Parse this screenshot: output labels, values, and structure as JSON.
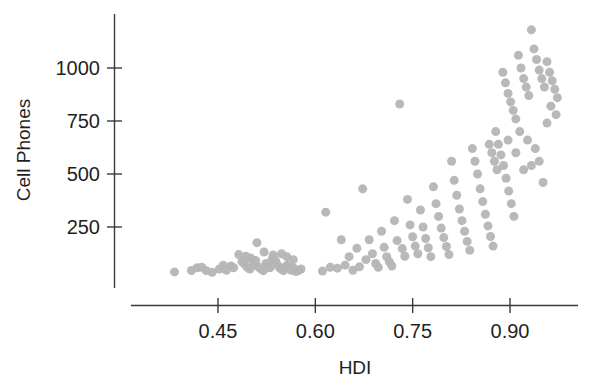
{
  "chart_data": {
    "type": "scatter",
    "title": "",
    "xlabel": "HDI",
    "ylabel": "Cell Phones",
    "xlim": [
      0.36,
      0.99
    ],
    "ylim": [
      0,
      1210
    ],
    "xticks": [
      0.45,
      0.6,
      0.75,
      0.9
    ],
    "xticklabels": [
      "0.45",
      "0.60",
      "0.75",
      "0.90"
    ],
    "yticks": [
      250,
      500,
      750,
      1000
    ],
    "yticklabels": [
      "250",
      "500",
      "750",
      "1000"
    ],
    "grid": false,
    "legend": null,
    "marker": {
      "shape": "circle",
      "color": "#b5b5b5",
      "size": 9,
      "opacity": 0.95
    },
    "axis_color": "#3a3a3a",
    "background": "#ffffff",
    "n_points": 152,
    "points": [
      [
        0.383,
        38
      ],
      [
        0.409,
        45
      ],
      [
        0.418,
        58
      ],
      [
        0.425,
        60
      ],
      [
        0.432,
        44
      ],
      [
        0.441,
        36
      ],
      [
        0.452,
        52
      ],
      [
        0.458,
        70
      ],
      [
        0.463,
        46
      ],
      [
        0.47,
        66
      ],
      [
        0.474,
        58
      ],
      [
        0.482,
        120
      ],
      [
        0.487,
        86
      ],
      [
        0.491,
        74
      ],
      [
        0.495,
        60
      ],
      [
        0.499,
        52
      ],
      [
        0.503,
        96
      ],
      [
        0.506,
        70
      ],
      [
        0.51,
        176
      ],
      [
        0.513,
        60
      ],
      [
        0.517,
        50
      ],
      [
        0.52,
        44
      ],
      [
        0.524,
        78
      ],
      [
        0.527,
        62
      ],
      [
        0.53,
        58
      ],
      [
        0.533,
        96
      ],
      [
        0.536,
        102
      ],
      [
        0.539,
        88
      ],
      [
        0.542,
        70
      ],
      [
        0.545,
        58
      ],
      [
        0.548,
        50
      ],
      [
        0.551,
        44
      ],
      [
        0.554,
        62
      ],
      [
        0.557,
        70
      ],
      [
        0.56,
        56
      ],
      [
        0.563,
        46
      ],
      [
        0.566,
        58
      ],
      [
        0.57,
        40
      ],
      [
        0.574,
        44
      ],
      [
        0.578,
        52
      ],
      [
        0.521,
        132
      ],
      [
        0.535,
        118
      ],
      [
        0.548,
        124
      ],
      [
        0.556,
        110
      ],
      [
        0.566,
        96
      ],
      [
        0.5,
        104
      ],
      [
        0.508,
        92
      ],
      [
        0.493,
        112
      ],
      [
        0.611,
        42
      ],
      [
        0.616,
        320
      ],
      [
        0.623,
        60
      ],
      [
        0.634,
        56
      ],
      [
        0.64,
        190
      ],
      [
        0.646,
        70
      ],
      [
        0.652,
        110
      ],
      [
        0.658,
        46
      ],
      [
        0.664,
        150
      ],
      [
        0.668,
        62
      ],
      [
        0.673,
        430
      ],
      [
        0.678,
        96
      ],
      [
        0.683,
        190
      ],
      [
        0.688,
        124
      ],
      [
        0.693,
        78
      ],
      [
        0.697,
        60
      ],
      [
        0.702,
        230
      ],
      [
        0.706,
        154
      ],
      [
        0.71,
        110
      ],
      [
        0.714,
        86
      ],
      [
        0.718,
        66
      ],
      [
        0.722,
        280
      ],
      [
        0.726,
        186
      ],
      [
        0.73,
        830
      ],
      [
        0.734,
        148
      ],
      [
        0.738,
        112
      ],
      [
        0.742,
        380
      ],
      [
        0.746,
        260
      ],
      [
        0.75,
        204
      ],
      [
        0.754,
        160
      ],
      [
        0.758,
        124
      ],
      [
        0.762,
        330
      ],
      [
        0.766,
        250
      ],
      [
        0.77,
        196
      ],
      [
        0.774,
        152
      ],
      [
        0.778,
        110
      ],
      [
        0.782,
        440
      ],
      [
        0.786,
        360
      ],
      [
        0.79,
        300
      ],
      [
        0.794,
        245
      ],
      [
        0.798,
        200
      ],
      [
        0.802,
        158
      ],
      [
        0.806,
        120
      ],
      [
        0.81,
        560
      ],
      [
        0.814,
        470
      ],
      [
        0.818,
        400
      ],
      [
        0.822,
        335
      ],
      [
        0.826,
        280
      ],
      [
        0.83,
        230
      ],
      [
        0.834,
        182
      ],
      [
        0.838,
        140
      ],
      [
        0.842,
        620
      ],
      [
        0.846,
        560
      ],
      [
        0.85,
        500
      ],
      [
        0.854,
        430
      ],
      [
        0.858,
        370
      ],
      [
        0.862,
        310
      ],
      [
        0.866,
        255
      ],
      [
        0.87,
        205
      ],
      [
        0.874,
        160
      ],
      [
        0.878,
        700
      ],
      [
        0.882,
        640
      ],
      [
        0.886,
        590
      ],
      [
        0.89,
        540
      ],
      [
        0.894,
        480
      ],
      [
        0.898,
        420
      ],
      [
        0.902,
        360
      ],
      [
        0.906,
        300
      ],
      [
        0.868,
        640
      ],
      [
        0.872,
        600
      ],
      [
        0.876,
        560
      ],
      [
        0.88,
        520
      ],
      [
        0.889,
        980
      ],
      [
        0.893,
        930
      ],
      [
        0.897,
        880
      ],
      [
        0.901,
        840
      ],
      [
        0.905,
        800
      ],
      [
        0.909,
        760
      ],
      [
        0.913,
        1060
      ],
      [
        0.917,
        1000
      ],
      [
        0.921,
        950
      ],
      [
        0.925,
        910
      ],
      [
        0.929,
        870
      ],
      [
        0.933,
        1180
      ],
      [
        0.937,
        1090
      ],
      [
        0.941,
        1040
      ],
      [
        0.945,
        990
      ],
      [
        0.949,
        950
      ],
      [
        0.953,
        910
      ],
      [
        0.957,
        1030
      ],
      [
        0.961,
        980
      ],
      [
        0.965,
        940
      ],
      [
        0.969,
        900
      ],
      [
        0.973,
        860
      ],
      [
        0.915,
        700
      ],
      [
        0.927,
        660
      ],
      [
        0.939,
        620
      ],
      [
        0.951,
        460
      ],
      [
        0.963,
        820
      ],
      [
        0.971,
        780
      ],
      [
        0.957,
        740
      ],
      [
        0.945,
        560
      ],
      [
        0.933,
        540
      ],
      [
        0.921,
        520
      ],
      [
        0.909,
        600
      ],
      [
        0.897,
        660
      ]
    ]
  }
}
